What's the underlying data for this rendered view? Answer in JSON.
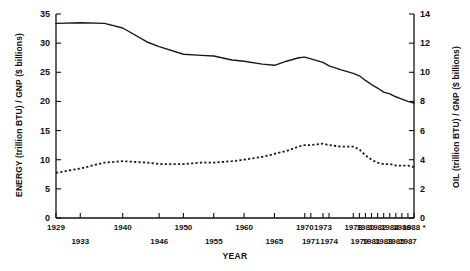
{
  "chart_data": {
    "type": "line",
    "title": "",
    "xlabel": "YEAR",
    "ylabel": "ENERGY (trillion BTU) / GNP ($ billions)",
    "y2label": "OIL (trillion BTU) / GNP ($ billions)",
    "xlim": [
      1929,
      1988
    ],
    "ylim": [
      0,
      35
    ],
    "y2lim": [
      0,
      14
    ],
    "grid": false,
    "legend": "none",
    "y_ticks": [
      0,
      5,
      10,
      15,
      20,
      25,
      30,
      35
    ],
    "y2_ticks": [
      0,
      2,
      4,
      6,
      8,
      10,
      12,
      14
    ],
    "x_tick_labels_upper": [
      "1929",
      "1940",
      "1950",
      "1960",
      "1970",
      "1973",
      "1978",
      "1980",
      "1982",
      "1984",
      "1986",
      "1988 *"
    ],
    "x_tick_labels_lower": [
      "1933",
      "1946",
      "1955",
      "1965",
      "1971",
      "1974",
      "1979",
      "1981",
      "1983",
      "1985",
      "1987"
    ],
    "x_tick_years": [
      1929,
      1933,
      1940,
      1946,
      1950,
      1955,
      1960,
      1965,
      1970,
      1971,
      1973,
      1974,
      1978,
      1979,
      1980,
      1981,
      1982,
      1983,
      1984,
      1985,
      1986,
      1987,
      1988
    ],
    "series": [
      {
        "name": "ENERGY (trillion BTU) / GNP ($ billions)",
        "axis": "left",
        "style": "solid",
        "color": "#1a1a1a",
        "x": [
          1929,
          1933,
          1937,
          1940,
          1944,
          1946,
          1950,
          1953,
          1955,
          1958,
          1960,
          1963,
          1965,
          1967,
          1969,
          1970,
          1971,
          1973,
          1974,
          1976,
          1978,
          1979,
          1980,
          1981,
          1982,
          1983,
          1984,
          1985,
          1986,
          1987,
          1988
        ],
        "y": [
          33.4,
          33.5,
          33.4,
          32.6,
          30.2,
          29.4,
          28.1,
          27.9,
          27.8,
          27.1,
          26.9,
          26.4,
          26.2,
          26.9,
          27.5,
          27.6,
          27.3,
          26.7,
          26.1,
          25.4,
          24.8,
          24.4,
          23.6,
          22.9,
          22.3,
          21.6,
          21.3,
          20.8,
          20.4,
          20.0,
          19.7
        ]
      },
      {
        "name": "OIL (trillion BTU) / GNP ($ billions)",
        "axis": "right",
        "style": "dotted",
        "color": "#1a1a1a",
        "x": [
          1929,
          1933,
          1937,
          1940,
          1944,
          1946,
          1950,
          1953,
          1955,
          1958,
          1960,
          1963,
          1965,
          1967,
          1969,
          1970,
          1971,
          1973,
          1974,
          1976,
          1978,
          1979,
          1980,
          1981,
          1982,
          1983,
          1984,
          1985,
          1986,
          1987,
          1988
        ],
        "y": [
          3.1,
          3.4,
          3.8,
          3.9,
          3.8,
          3.7,
          3.7,
          3.8,
          3.8,
          3.9,
          4.0,
          4.2,
          4.4,
          4.6,
          4.9,
          5.0,
          5.0,
          5.1,
          5.0,
          4.9,
          4.9,
          4.7,
          4.3,
          4.0,
          3.8,
          3.7,
          3.7,
          3.6,
          3.6,
          3.6,
          3.5
        ]
      }
    ]
  },
  "axes": {
    "left_title": "ENERGY (trillion BTU) / GNP ($ billions)",
    "right_title": "OIL (trillion BTU) / GNP ($ billions)",
    "x_title": "YEAR"
  }
}
